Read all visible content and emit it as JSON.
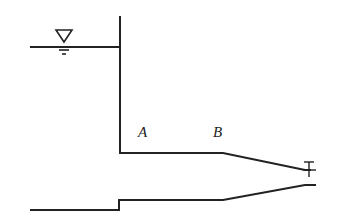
{
  "diagram": {
    "type": "reservoir-pipe-nozzle",
    "labels": {
      "a": "A",
      "b": "B"
    },
    "symbols": {
      "water_surface": "water-level-triangle",
      "outlet": "valve-symbol"
    },
    "colors": {
      "line": "#222222",
      "background": "#ffffff"
    }
  }
}
